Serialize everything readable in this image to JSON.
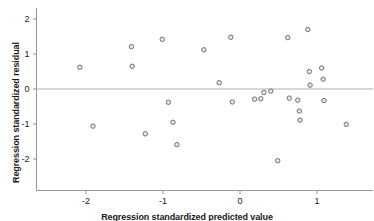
{
  "chart_data": {
    "type": "scatter",
    "title": "",
    "xlabel": "Regression standardized predicted value",
    "ylabel": "Regression standardized residual",
    "xlim": [
      -2.75,
      1.78
    ],
    "ylim": [
      -2.4,
      2.3
    ],
    "xticks": [
      -2,
      -1,
      0,
      1
    ],
    "xtick_labels": [
      "-2",
      "-1",
      "0",
      "1"
    ],
    "yticks": [
      2,
      1,
      0,
      -1,
      -2
    ],
    "ytick_labels": [
      "2",
      "1",
      "0",
      "-1",
      "-2"
    ],
    "grid": false,
    "legend": "none",
    "reference_line": {
      "orientation": "horizontal",
      "value": 0,
      "color": "#b0b0b0"
    },
    "marker": {
      "shape": "circle",
      "edge_color": "#6e6e6e",
      "face_color": "#e8e8e8",
      "size": 4.4
    },
    "axis_color": "#9a9a9a",
    "points": [
      {
        "x": -2.08,
        "y": 0.62
      },
      {
        "x": -1.91,
        "y": -1.06
      },
      {
        "x": -1.41,
        "y": 1.21
      },
      {
        "x": -1.4,
        "y": 0.65
      },
      {
        "x": -1.23,
        "y": -1.28
      },
      {
        "x": -1.01,
        "y": 1.42
      },
      {
        "x": -0.93,
        "y": -0.38
      },
      {
        "x": -0.87,
        "y": -0.95
      },
      {
        "x": -0.82,
        "y": -1.59
      },
      {
        "x": -0.47,
        "y": 1.12
      },
      {
        "x": -0.27,
        "y": 0.18
      },
      {
        "x": -0.12,
        "y": 1.48
      },
      {
        "x": -0.1,
        "y": -0.37
      },
      {
        "x": 0.19,
        "y": -0.29
      },
      {
        "x": 0.27,
        "y": -0.28
      },
      {
        "x": 0.31,
        "y": -0.1
      },
      {
        "x": 0.4,
        "y": -0.06
      },
      {
        "x": 0.49,
        "y": -2.05
      },
      {
        "x": 0.62,
        "y": 1.47
      },
      {
        "x": 0.64,
        "y": -0.26
      },
      {
        "x": 0.75,
        "y": -0.32
      },
      {
        "x": 0.77,
        "y": -0.63
      },
      {
        "x": 0.78,
        "y": -0.89
      },
      {
        "x": 0.88,
        "y": 1.7
      },
      {
        "x": 0.9,
        "y": 0.5
      },
      {
        "x": 0.91,
        "y": 0.11
      },
      {
        "x": 1.06,
        "y": 0.6
      },
      {
        "x": 1.08,
        "y": 0.28
      },
      {
        "x": 1.09,
        "y": -0.33
      },
      {
        "x": 1.38,
        "y": -1.01
      }
    ]
  }
}
